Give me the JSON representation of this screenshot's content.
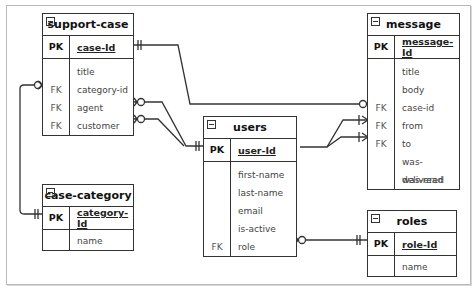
{
  "diagram": {
    "type": "entity-relationship",
    "entities": [
      {
        "name": "support-case",
        "pk": {
          "label": "PK",
          "field": "case-Id"
        },
        "fields": [
          {
            "key": "",
            "name": "title"
          },
          {
            "key": "FK",
            "name": "category-id"
          },
          {
            "key": "FK",
            "name": "agent"
          },
          {
            "key": "FK",
            "name": "customer"
          }
        ]
      },
      {
        "name": "message",
        "pk": {
          "label": "PK",
          "field": "message-Id"
        },
        "fields": [
          {
            "key": "",
            "name": "title"
          },
          {
            "key": "",
            "name": "body"
          },
          {
            "key": "FK",
            "name": "case-id"
          },
          {
            "key": "FK",
            "name": "from"
          },
          {
            "key": "FK",
            "name": "to"
          },
          {
            "key": "",
            "name": "was-delivered"
          },
          {
            "key": "",
            "name": "was-read"
          }
        ]
      },
      {
        "name": "users",
        "pk": {
          "label": "PK",
          "field": "user-Id"
        },
        "fields": [
          {
            "key": "",
            "name": "first-name"
          },
          {
            "key": "",
            "name": "last-name"
          },
          {
            "key": "",
            "name": "email"
          },
          {
            "key": "",
            "name": "is-active"
          },
          {
            "key": "FK",
            "name": "role"
          }
        ]
      },
      {
        "name": "case-category",
        "pk": {
          "label": "PK",
          "field": "category-Id"
        },
        "fields": [
          {
            "key": "",
            "name": "name"
          }
        ]
      },
      {
        "name": "roles",
        "pk": {
          "label": "PK",
          "field": "role-Id"
        },
        "fields": [
          {
            "key": "",
            "name": "name"
          }
        ]
      }
    ],
    "relationships": [
      {
        "from": "support-case.case-Id",
        "from_card": "one-and-only-one",
        "to": "message.case-id",
        "to_card": "zero-or-many"
      },
      {
        "from": "case-category.category-Id",
        "from_card": "one-and-only-one",
        "to": "support-case.category-id",
        "to_card": "zero-or-many"
      },
      {
        "from": "users.user-Id",
        "from_card": "one-and-only-one",
        "to": "support-case.agent",
        "to_card": "zero-or-many"
      },
      {
        "from": "users.user-Id",
        "from_card": "one-and-only-one",
        "to": "support-case.customer",
        "to_card": "zero-or-many"
      },
      {
        "from": "users.user-Id",
        "from_card": "one-and-only-one",
        "to": "message.from",
        "to_card": "one-or-many"
      },
      {
        "from": "users.user-Id",
        "from_card": "one-and-only-one",
        "to": "message.to",
        "to_card": "one-or-many"
      },
      {
        "from": "roles.role-Id",
        "from_card": "one-and-only-one",
        "to": "users.role",
        "to_card": "zero-or-many"
      }
    ]
  }
}
